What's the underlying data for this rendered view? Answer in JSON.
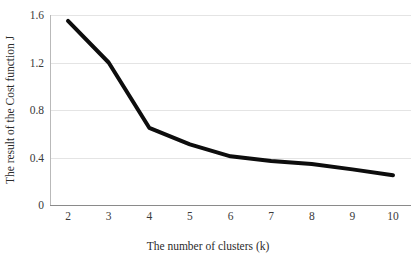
{
  "chart_data": {
    "type": "line",
    "title": "",
    "xlabel": "The number of clusters (k)",
    "ylabel": "The result of the Cost function J",
    "x": [
      2,
      3,
      4,
      5,
      6,
      7,
      8,
      9,
      10
    ],
    "values": [
      1.55,
      1.2,
      0.65,
      0.51,
      0.41,
      0.37,
      0.345,
      0.3,
      0.25
    ],
    "series": [
      {
        "name": "Cost function J",
        "values": [
          1.55,
          1.2,
          0.65,
          0.51,
          0.41,
          0.37,
          0.345,
          0.3,
          0.25
        ]
      }
    ],
    "xtick_labels": [
      "2",
      "3",
      "4",
      "5",
      "6",
      "7",
      "8",
      "9",
      "10"
    ],
    "ytick_labels": [
      "0",
      "0.4",
      "0.8",
      "1.2",
      "1.6"
    ],
    "ytick_values": [
      0,
      0.4,
      0.8,
      1.2,
      1.6
    ],
    "xlim": [
      2,
      10
    ],
    "ylim": [
      0,
      1.6
    ],
    "grid": "horizontal",
    "legend": "none",
    "line_color": "#0d0d0d",
    "line_width": 4,
    "grid_color": "#e4e4e4",
    "background_color": "#ffffff",
    "annotations": []
  }
}
